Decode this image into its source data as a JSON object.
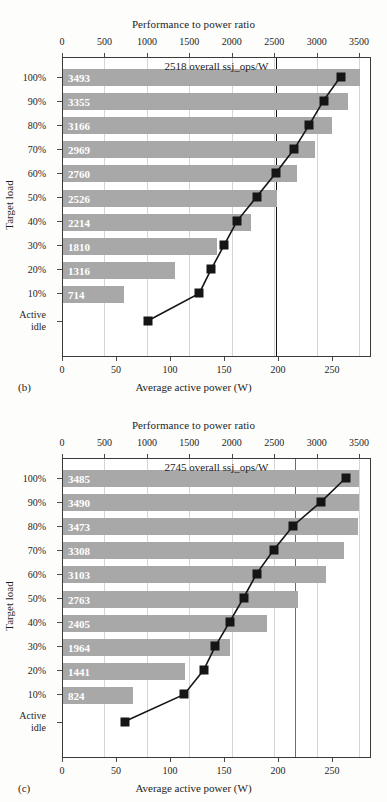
{
  "figure": {
    "top_axis_title": "Performance to power ratio",
    "bottom_axis_title": "Average active power (W)",
    "y_axis_title": "Target load",
    "top_ticks": [
      0,
      500,
      1000,
      1500,
      2000,
      2500,
      3000,
      3500
    ],
    "bottom_ticks": [
      0,
      50,
      100,
      150,
      200,
      250
    ],
    "top_axis_max": 3640,
    "bottom_axis_max": 286,
    "load_labels": [
      "100%",
      "90%",
      "80%",
      "70%",
      "60%",
      "50%",
      "40%",
      "30%",
      "20%",
      "10%"
    ],
    "idle_label_line1": "Active",
    "idle_label_line2": "idle",
    "bar_color": "#a8a8a8",
    "marker_color": "#151515"
  },
  "panels": [
    {
      "letter": "(b)",
      "overall_label": "2518 overall ssj_ops/W",
      "overall_value": 2518,
      "chart_data": {
        "type": "bar",
        "title": "",
        "xlabel": "Performance to power ratio",
        "ylabel": "Target load",
        "categories": [
          "100%",
          "90%",
          "80%",
          "70%",
          "60%",
          "50%",
          "40%",
          "30%",
          "20%",
          "10%"
        ],
        "values": [
          3493,
          3355,
          3166,
          2969,
          2760,
          2526,
          2214,
          1810,
          1316,
          714
        ],
        "xlim": [
          0,
          3640
        ],
        "grid": true,
        "legend": "none",
        "overlay_series": {
          "type": "line",
          "name": "Average active power (W)",
          "xlabel": "Average active power (W)",
          "x": [
            258,
            242,
            229,
            215,
            198,
            180,
            162,
            150,
            138,
            127,
            80
          ],
          "categories": [
            "100%",
            "90%",
            "80%",
            "70%",
            "60%",
            "50%",
            "40%",
            "30%",
            "20%",
            "10%",
            "Active idle"
          ],
          "xlim": [
            0,
            286
          ]
        }
      }
    },
    {
      "letter": "(c)",
      "overall_label": "2745 overall ssj_ops/W",
      "overall_value": 2745,
      "chart_data": {
        "type": "bar",
        "title": "",
        "xlabel": "Performance to power ratio",
        "ylabel": "Target load",
        "categories": [
          "100%",
          "90%",
          "80%",
          "70%",
          "60%",
          "50%",
          "40%",
          "30%",
          "20%",
          "10%"
        ],
        "values": [
          3485,
          3490,
          3473,
          3308,
          3103,
          2763,
          2405,
          1964,
          1441,
          824
        ],
        "xlim": [
          0,
          3640
        ],
        "grid": true,
        "legend": "none",
        "overlay_series": {
          "type": "line",
          "name": "Average active power (W)",
          "xlabel": "Average active power (W)",
          "x": [
            263,
            240,
            214,
            196,
            180,
            168,
            155,
            142,
            131,
            113,
            58
          ],
          "categories": [
            "100%",
            "90%",
            "80%",
            "70%",
            "60%",
            "50%",
            "40%",
            "30%",
            "20%",
            "10%",
            "Active idle"
          ],
          "xlim": [
            0,
            286
          ]
        }
      }
    }
  ]
}
